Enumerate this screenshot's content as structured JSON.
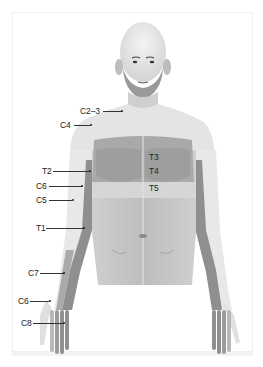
{
  "diagram": {
    "type": "dermatome-map",
    "view": "anterior upper body",
    "colors": {
      "background": "#ffffff",
      "skin_light": "#e9e9e9",
      "skin_mid": "#bdbdbd",
      "band_dark": "#8f8f8f",
      "band_medium": "#a9a9a9",
      "band_light": "#d2d2d2",
      "text": "#222222"
    },
    "labels": [
      {
        "id": "c2-3",
        "text": "C2–3",
        "region": "neck"
      },
      {
        "id": "c4",
        "text": "C4",
        "region": "shoulder / upper chest"
      },
      {
        "id": "t3",
        "text": "T3",
        "region": "chest"
      },
      {
        "id": "t4",
        "text": "T4",
        "region": "chest (nipple line)"
      },
      {
        "id": "t5",
        "text": "T5",
        "region": "lower chest band"
      },
      {
        "id": "t2",
        "text": "T2",
        "region": "upper inner arm"
      },
      {
        "id": "c6-arm",
        "text": "C6",
        "region": "lateral upper arm"
      },
      {
        "id": "c5",
        "text": "C5",
        "region": "lateral arm"
      },
      {
        "id": "t1",
        "text": "T1",
        "region": "medial forearm"
      },
      {
        "id": "c7",
        "text": "C7",
        "region": "forearm"
      },
      {
        "id": "c6-hand",
        "text": "C6",
        "region": "thumb"
      },
      {
        "id": "c8",
        "text": "C8",
        "region": "little/ring fingers"
      }
    ]
  }
}
